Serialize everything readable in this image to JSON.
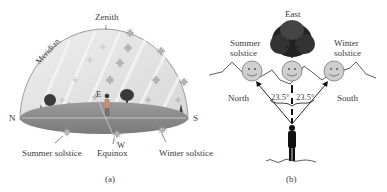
{
  "panel_a": {
    "caption": "(a)",
    "labels": {
      "zenith": "Zenith",
      "meridian": "Meridian",
      "north": "N",
      "south": "S",
      "east": "E",
      "west": "W",
      "summer_solstice": "Summer solstice",
      "equinox": "Equinox",
      "winter_solstice": "Winter solstice"
    }
  },
  "panel_b": {
    "caption": "(b)",
    "labels": {
      "east": "East",
      "summer_solstice_line1": "Summer",
      "summer_solstice_line2": "solstice",
      "winter_solstice_line1": "Winter",
      "winter_solstice_line2": "solstice",
      "north": "North",
      "south": "South",
      "angle_left": "23.5°",
      "angle_right": "23.5°"
    }
  },
  "colors": {
    "dome_fill": "#e4e4e4",
    "dome_stroke": "#9a9a9a",
    "ground": "#8a8a8a",
    "sun_fill": "#cfcfcf",
    "star_color": "#a0a0a0",
    "ink": "#111111"
  }
}
